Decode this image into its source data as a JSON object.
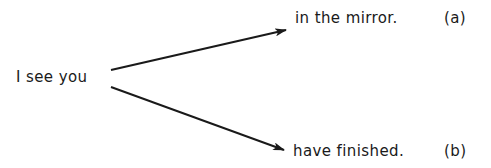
{
  "diagram": {
    "source": {
      "text": "I see you"
    },
    "branches": [
      {
        "text": "in the mirror.",
        "tag": "(a)"
      },
      {
        "text": "have finished.",
        "tag": "(b)"
      }
    ],
    "edges": [
      {
        "from": "I see you",
        "to": "in the mirror."
      },
      {
        "from": "I see you",
        "to": "have finished."
      }
    ],
    "colors": {
      "ink": "#1a1a1a",
      "background": "#ffffff"
    }
  }
}
